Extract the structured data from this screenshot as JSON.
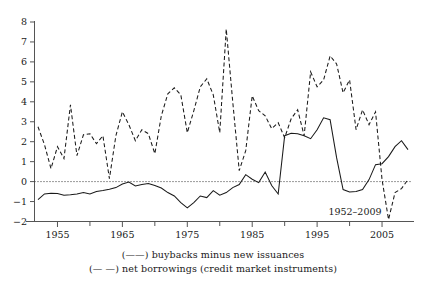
{
  "chart_data": {
    "type": "line",
    "title": "",
    "subtitle": "",
    "xlabel": "",
    "ylabel": "",
    "annotation": "1952–2009",
    "xlim": [
      1952,
      2009
    ],
    "ylim": [
      -2,
      8
    ],
    "yticks": [
      -2,
      -1,
      0,
      1,
      2,
      3,
      4,
      5,
      6,
      7,
      8
    ],
    "ytick_labels": [
      "-2",
      "-1",
      "0",
      "1",
      "2",
      "3",
      "4",
      "5",
      "6",
      "7",
      "8"
    ],
    "xticks": [
      1955,
      1965,
      1975,
      1985,
      1995,
      2005
    ],
    "xtick_labels": [
      "1955",
      "1965",
      "1975",
      "1985",
      "1995",
      "2005"
    ],
    "xminor_ticks": [
      1960,
      1970,
      1980,
      1990,
      2000
    ],
    "grid": false,
    "zero_line": true,
    "legend_position": "below",
    "series": [
      {
        "name": "buybacks minus new issuances",
        "style": "solid",
        "color": "#1a1a1a",
        "x": [
          1952,
          1953,
          1954,
          1955,
          1956,
          1957,
          1958,
          1959,
          1960,
          1961,
          1962,
          1963,
          1964,
          1965,
          1966,
          1967,
          1968,
          1969,
          1970,
          1971,
          1972,
          1973,
          1974,
          1975,
          1976,
          1977,
          1978,
          1979,
          1980,
          1981,
          1982,
          1983,
          1984,
          1985,
          1986,
          1987,
          1988,
          1989,
          1990,
          1991,
          1992,
          1993,
          1994,
          1995,
          1996,
          1997,
          1998,
          1999,
          2000,
          2001,
          2002,
          2003,
          2004,
          2005,
          2006,
          2007,
          2008,
          2009
        ],
        "values": [
          -0.9,
          -0.62,
          -0.58,
          -0.6,
          -0.68,
          -0.66,
          -0.62,
          -0.55,
          -0.62,
          -0.5,
          -0.45,
          -0.38,
          -0.3,
          -0.12,
          -0.02,
          -0.22,
          -0.15,
          -0.1,
          -0.2,
          -0.32,
          -0.55,
          -0.72,
          -1.05,
          -1.32,
          -1.05,
          -0.72,
          -0.8,
          -0.45,
          -0.68,
          -0.55,
          -0.3,
          -0.15,
          0.35,
          0.12,
          -0.05,
          0.48,
          -0.2,
          -0.62,
          2.3,
          2.42,
          2.4,
          2.3,
          2.15,
          2.6,
          3.2,
          3.1,
          1.2,
          -0.4,
          -0.52,
          -0.5,
          -0.4,
          0.1,
          0.85,
          0.9,
          1.25,
          1.75,
          2.05,
          1.6
        ]
      },
      {
        "name": "net borrowings (credit market instruments)",
        "style": "dashed",
        "color": "#1a1a1a",
        "x": [
          1952,
          1953,
          1954,
          1955,
          1956,
          1957,
          1958,
          1959,
          1960,
          1961,
          1962,
          1963,
          1964,
          1965,
          1966,
          1967,
          1968,
          1969,
          1970,
          1971,
          1972,
          1973,
          1974,
          1975,
          1976,
          1977,
          1978,
          1979,
          1980,
          1981,
          1982,
          1983,
          1984,
          1985,
          1986,
          1987,
          1988,
          1989,
          1990,
          1991,
          1992,
          1993,
          1994,
          1995,
          1996,
          1997,
          1998,
          1999,
          2000,
          2001,
          2002,
          2003,
          2004,
          2005,
          2006,
          2007,
          2008,
          2009
        ],
        "values": [
          2.75,
          1.85,
          0.65,
          1.75,
          1.15,
          3.85,
          1.3,
          2.35,
          2.4,
          1.9,
          2.3,
          0.15,
          2.3,
          3.5,
          2.85,
          2.05,
          2.6,
          2.4,
          1.4,
          3.3,
          4.4,
          4.7,
          4.35,
          2.45,
          3.55,
          4.75,
          5.15,
          4.35,
          2.45,
          7.65,
          4.0,
          0.55,
          1.55,
          4.3,
          3.55,
          3.3,
          2.65,
          2.95,
          2.2,
          3.15,
          3.6,
          2.3,
          5.5,
          4.75,
          5.1,
          6.3,
          5.9,
          4.45,
          5.1,
          2.6,
          3.6,
          2.85,
          3.5,
          0.1,
          -1.9,
          -0.55,
          -0.35,
          0.1
        ]
      }
    ],
    "series_extra_note": "second series continues: 1996-2009 values rendered along drawn path"
  },
  "legend": {
    "entries": [
      {
        "key": "(——)",
        "style": "solid",
        "label": "buybacks minus new issuances"
      },
      {
        "key": "(— —)",
        "style": "dashed",
        "label": "net borrowings (credit market instruments)"
      }
    ]
  },
  "axes": {
    "y_axis_name": "y-axis",
    "x_axis_name": "x-axis"
  }
}
